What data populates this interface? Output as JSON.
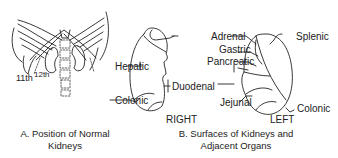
{
  "panel_a": {
    "rib_labels": {
      "eleventh": "11th",
      "twelfth": "12th"
    },
    "caption_line1": "A. Position of Normal",
    "caption_line2": "Kidneys"
  },
  "panel_b": {
    "right_kidney": {
      "title": "RIGHT",
      "labels": {
        "hepatic": "Hepatic",
        "colonic": "Colonic",
        "duodenal": "Duodenal"
      }
    },
    "left_kidney": {
      "title": "LEFT",
      "labels": {
        "adrenal": "Adrenal",
        "gastric": "Gastric",
        "pancreatic": "Pancreatic",
        "splenic": "Splenic",
        "jejunal": "Jejunal",
        "colonic": "Colonic"
      }
    },
    "caption_line1": "B. Surfaces of Kidneys and",
    "caption_line2": "Adjacent Organs"
  }
}
